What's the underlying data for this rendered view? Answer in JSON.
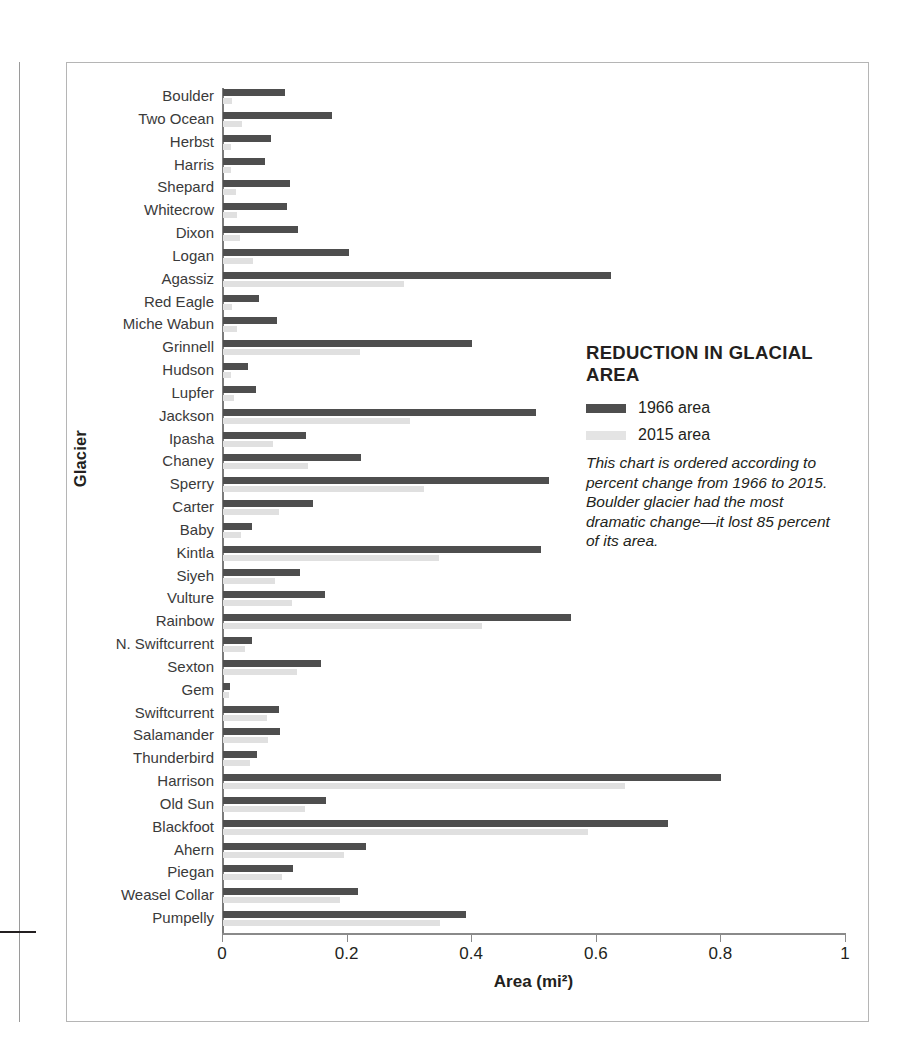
{
  "panel": {
    "title": "REDUCTION IN GLACIAL AREA",
    "legend": [
      {
        "label": "1966 area",
        "swatch": "dark-swatch-icon",
        "color": "#4e4e4e"
      },
      {
        "label": "2015 area",
        "swatch": "light-swatch-icon",
        "color": "#e4e4e4"
      }
    ],
    "caption": "This chart is ordered according to percent change from 1966 to 2015. Boulder glacier had the most dramatic change—it lost 85 percent of its area."
  },
  "chart_data": {
    "type": "bar",
    "orientation": "horizontal",
    "title": "REDUCTION IN GLACIAL AREA",
    "xlabel": "Area (mi²)",
    "ylabel": "Glacier",
    "xlim": [
      0,
      1
    ],
    "xticks": [
      0,
      0.2,
      0.4,
      0.6,
      0.8,
      1
    ],
    "xtick_labels": [
      "0",
      "0.2",
      "0.4",
      "0.6",
      "0.8",
      "1"
    ],
    "grid": false,
    "legend_position": "right",
    "categories": [
      "Boulder",
      "Two Ocean",
      "Herbst",
      "Harris",
      "Shepard",
      "Whitecrow",
      "Dixon",
      "Logan",
      "Agassiz",
      "Red Eagle",
      "Miche Wabun",
      "Grinnell",
      "Hudson",
      "Lupfer",
      "Jackson",
      "Ipasha",
      "Chaney",
      "Sperry",
      "Carter",
      "Baby",
      "Kintla",
      "Siyeh",
      "Vulture",
      "Rainbow",
      "N. Swiftcurrent",
      "Sexton",
      "Gem",
      "Swiftcurrent",
      "Salamander",
      "Thunderbird",
      "Harrison",
      "Old Sun",
      "Blackfoot",
      "Ahern",
      "Piegan",
      "Weasel Collar",
      "Pumpelly"
    ],
    "series": [
      {
        "name": "1966 area",
        "color": "#4e4e4e",
        "values": [
          0.1,
          0.175,
          0.077,
          0.068,
          0.107,
          0.103,
          0.12,
          0.202,
          0.623,
          0.058,
          0.087,
          0.4,
          0.04,
          0.053,
          0.503,
          0.134,
          0.222,
          0.523,
          0.144,
          0.046,
          0.51,
          0.123,
          0.163,
          0.558,
          0.047,
          0.158,
          0.012,
          0.09,
          0.091,
          0.054,
          0.8,
          0.165,
          0.714,
          0.23,
          0.112,
          0.216,
          0.39
        ]
      },
      {
        "name": "2015 area",
        "color": "#e0e0e0",
        "values": [
          0.015,
          0.031,
          0.013,
          0.013,
          0.021,
          0.022,
          0.027,
          0.048,
          0.29,
          0.014,
          0.022,
          0.22,
          0.013,
          0.018,
          0.3,
          0.081,
          0.136,
          0.322,
          0.09,
          0.029,
          0.347,
          0.084,
          0.11,
          0.415,
          0.035,
          0.118,
          0.01,
          0.07,
          0.072,
          0.043,
          0.645,
          0.132,
          0.586,
          0.195,
          0.095,
          0.188,
          0.348
        ]
      }
    ]
  }
}
